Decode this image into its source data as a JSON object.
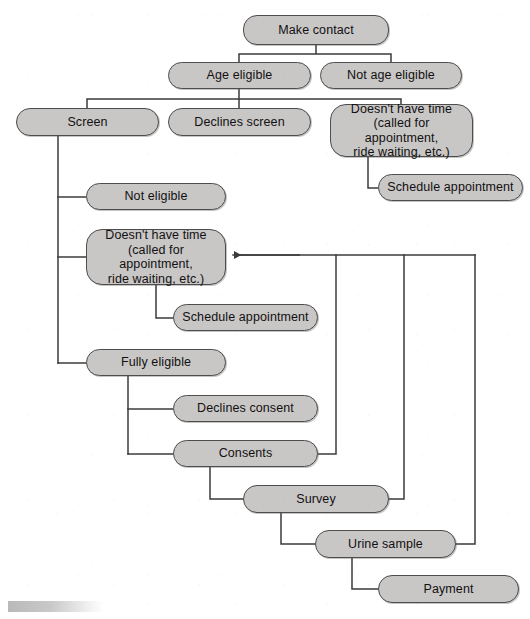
{
  "diagram": {
    "type": "flowchart",
    "background_color": "#ffffff",
    "node_fill_color": "#c9c6c6",
    "node_border_color": "#4d4d4d",
    "connector_color": "#3b3b3b",
    "text_color": "#111111",
    "nodes": [
      {
        "id": "make-contact",
        "label": "Make contact",
        "x": 243,
        "y": 15,
        "w": 146,
        "h": 30,
        "multiline": false
      },
      {
        "id": "age-eligible",
        "label": "Age eligible",
        "x": 168,
        "y": 62,
        "w": 143,
        "h": 27,
        "multiline": false
      },
      {
        "id": "not-age-eligible",
        "label": "Not age eligible",
        "x": 320,
        "y": 62,
        "w": 142,
        "h": 27,
        "multiline": false
      },
      {
        "id": "screen",
        "label": "Screen",
        "x": 16,
        "y": 108,
        "w": 143,
        "h": 28,
        "multiline": false
      },
      {
        "id": "declines-screen",
        "label": "Declines screen",
        "x": 168,
        "y": 108,
        "w": 143,
        "h": 28,
        "multiline": false
      },
      {
        "id": "no-time-upper",
        "label": "Doesn't have time\n(called for appointment,\nride waiting, etc.)",
        "x": 330,
        "y": 104,
        "w": 143,
        "h": 53,
        "multiline": true
      },
      {
        "id": "schedule-appointment-upper",
        "label": "Schedule appointment",
        "x": 378,
        "y": 174,
        "w": 145,
        "h": 27,
        "multiline": false
      },
      {
        "id": "not-eligible",
        "label": "Not eligible",
        "x": 86,
        "y": 183,
        "w": 140,
        "h": 27,
        "multiline": false
      },
      {
        "id": "no-time-lower",
        "label": "Doesn't have time\n(called for appointment,\nride waiting, etc.)",
        "x": 86,
        "y": 229,
        "w": 140,
        "h": 56,
        "multiline": true
      },
      {
        "id": "schedule-appointment-lower",
        "label": "Schedule appointment",
        "x": 173,
        "y": 304,
        "w": 145,
        "h": 27,
        "multiline": false
      },
      {
        "id": "fully-eligible",
        "label": "Fully eligible",
        "x": 86,
        "y": 349,
        "w": 140,
        "h": 27,
        "multiline": false
      },
      {
        "id": "declines-consent",
        "label": "Declines consent",
        "x": 173,
        "y": 395,
        "w": 145,
        "h": 27,
        "multiline": false
      },
      {
        "id": "consents",
        "label": "Consents",
        "x": 173,
        "y": 440,
        "w": 145,
        "h": 27,
        "multiline": false
      },
      {
        "id": "survey",
        "label": "Survey",
        "x": 243,
        "y": 485,
        "w": 146,
        "h": 28,
        "multiline": false
      },
      {
        "id": "urine-sample",
        "label": "Urine sample",
        "x": 315,
        "y": 530,
        "w": 141,
        "h": 28,
        "multiline": false
      },
      {
        "id": "payment",
        "label": "Payment",
        "x": 378,
        "y": 575,
        "w": 141,
        "h": 28,
        "multiline": false
      }
    ],
    "edges": [
      {
        "id": "make-contact-to-age-eligible",
        "from": "make-contact",
        "to": "age-eligible",
        "kind": "split"
      },
      {
        "id": "make-contact-to-not-age-eligible",
        "from": "make-contact",
        "to": "not-age-eligible",
        "kind": "split"
      },
      {
        "id": "age-eligible-to-screen",
        "from": "age-eligible",
        "to": "screen",
        "kind": "split"
      },
      {
        "id": "age-eligible-to-declines-screen",
        "from": "age-eligible",
        "to": "declines-screen",
        "kind": "split"
      },
      {
        "id": "age-eligible-to-no-time-upper",
        "from": "age-eligible",
        "to": "no-time-upper",
        "kind": "split"
      },
      {
        "id": "no-time-upper-to-schedule-upper",
        "from": "no-time-upper",
        "to": "schedule-appointment-upper",
        "kind": "elbow"
      },
      {
        "id": "screen-to-not-eligible",
        "from": "screen",
        "to": "not-eligible",
        "kind": "elbow"
      },
      {
        "id": "screen-to-no-time-lower",
        "from": "screen",
        "to": "no-time-lower",
        "kind": "elbow"
      },
      {
        "id": "screen-to-fully-eligible",
        "from": "screen",
        "to": "fully-eligible",
        "kind": "elbow"
      },
      {
        "id": "no-time-lower-to-schedule-lower",
        "from": "no-time-lower",
        "to": "schedule-appointment-lower",
        "kind": "elbow"
      },
      {
        "id": "fully-eligible-to-declines-consent",
        "from": "fully-eligible",
        "to": "declines-consent",
        "kind": "elbow"
      },
      {
        "id": "fully-eligible-to-consents",
        "from": "fully-eligible",
        "to": "consents",
        "kind": "elbow"
      },
      {
        "id": "consents-to-survey",
        "from": "consents",
        "to": "survey",
        "kind": "elbow"
      },
      {
        "id": "survey-to-urine-sample",
        "from": "survey",
        "to": "urine-sample",
        "kind": "elbow"
      },
      {
        "id": "urine-sample-to-payment",
        "from": "urine-sample",
        "to": "payment",
        "kind": "elbow"
      },
      {
        "id": "consents-to-no-time-lower-feedback",
        "from": "consents",
        "to": "no-time-lower",
        "kind": "feedback-arrow"
      },
      {
        "id": "survey-to-no-time-lower-feedback",
        "from": "survey",
        "to": "no-time-lower",
        "kind": "feedback-arrow"
      },
      {
        "id": "urine-sample-to-no-time-lower-feedback",
        "from": "urine-sample",
        "to": "no-time-lower",
        "kind": "feedback-arrow"
      }
    ]
  }
}
